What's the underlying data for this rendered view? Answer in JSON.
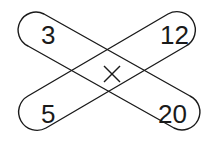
{
  "diagram": {
    "type": "crossed-capsules",
    "corners": {
      "top_left": "3",
      "top_right": "12",
      "bottom_left": "5",
      "bottom_right": "20"
    },
    "center_operator": "×",
    "stroke_color": "#1a1a1a",
    "background": "#ffffff"
  }
}
